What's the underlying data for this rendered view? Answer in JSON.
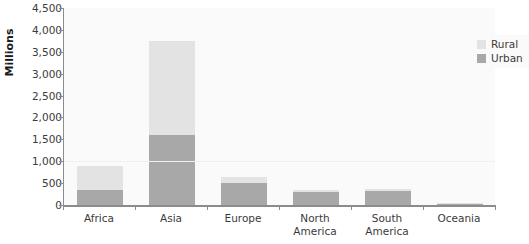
{
  "chart_data": {
    "type": "bar",
    "subtype": "stacked-bar",
    "title": "",
    "xlabel": "",
    "ylabel": "Millions",
    "ylim": [
      0,
      4500
    ],
    "ytick_step": 500,
    "ytick_labels": [
      "0",
      "500",
      "1,000",
      "1,500",
      "2,000",
      "2,500",
      "3,000",
      "3,500",
      "4,000",
      "4,500"
    ],
    "ytick_values": [
      0,
      500,
      1000,
      1500,
      2000,
      2500,
      3000,
      3500,
      4000,
      4500
    ],
    "grid": false,
    "legend_position": "top-right-inside",
    "categories": [
      "Africa",
      "Asia",
      "Europe",
      "North America",
      "South America",
      "Oceania"
    ],
    "series": [
      {
        "name": "Urban",
        "color": "#a8a8a8",
        "values": [
          350,
          1600,
          500,
          290,
          320,
          25
        ]
      },
      {
        "name": "Rural",
        "color": "#e3e3e3",
        "values": [
          550,
          2150,
          150,
          60,
          50,
          10
        ]
      }
    ],
    "totals": [
      900,
      3750,
      650,
      350,
      370,
      35
    ],
    "stack_order_bottom_to_top": [
      "Urban",
      "Rural"
    ]
  },
  "legend": {
    "items": [
      {
        "label": "Rural",
        "color": "#e3e3e3"
      },
      {
        "label": "Urban",
        "color": "#a8a8a8"
      }
    ]
  },
  "colors": {
    "rural": "#e3e3e3",
    "urban": "#a8a8a8",
    "axis": "#8c8c8c",
    "plot_background": "#fafafa",
    "page_background": "#ffffff",
    "text": "#3b3b3b",
    "title_text": "#1a1a1a"
  }
}
